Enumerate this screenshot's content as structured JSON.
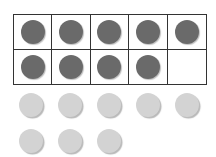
{
  "ten_frame": {
    "rows": 2,
    "columns": 5,
    "cells": [
      {
        "filled": true
      },
      {
        "filled": true
      },
      {
        "filled": true
      },
      {
        "filled": true
      },
      {
        "filled": true
      },
      {
        "filled": true
      },
      {
        "filled": true
      },
      {
        "filled": true
      },
      {
        "filled": true
      },
      {
        "filled": false
      }
    ],
    "filled_count": 9,
    "counter_color": "#6a6a6a",
    "line_color": "#333333"
  },
  "loose_counters": {
    "count": 8,
    "color": "#d3d3d3",
    "rows": [
      5,
      3
    ]
  }
}
